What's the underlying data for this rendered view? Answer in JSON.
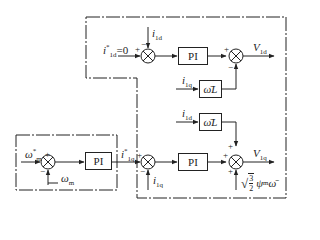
{
  "diagram": {
    "type": "PMSM vector control block diagram",
    "blocks": {
      "pi_d": "PI",
      "pi_speed": "PI",
      "pi_q": "PI",
      "wL_top": "ω̄L",
      "wL_bottom": "ω̄L"
    },
    "signals": {
      "i1d_ref": "i*1d=0",
      "i1d_ref_main": "i",
      "i1d_ref_sub": "1d",
      "i1d_ref_tail": "=0",
      "i1d_fb": "i",
      "i1d_fb_sub": "1d",
      "V1d": "V",
      "V1d_sub": "1d",
      "i1q_to_wL": "i",
      "i1q_to_wL_sub": "1q",
      "i1d_to_wL": "i",
      "i1d_to_wL_sub": "1d",
      "omega_ref": "ω",
      "omega_ref_sub": "m",
      "omega_fb": "ω",
      "omega_fb_sub": "m",
      "i1q_ref": "i",
      "i1q_ref_sub": "1q",
      "i1q_fb": "i",
      "i1q_fb_sub": "1q",
      "V1q": "V",
      "V1q_sub": "1q",
      "feedforward": "√(3/2) ψmω̄",
      "ff_psi": "ψ",
      "ff_psi_sub": "m",
      "ff_omega": "ω̄"
    },
    "signs": {
      "sum_d_plus": "+",
      "sum_d_minus": "−",
      "sum_vd_plus": "+",
      "sum_vd_minus": "−",
      "sum_speed_plus": "+",
      "sum_speed_minus": "−",
      "sum_q_plus": "+",
      "sum_q_minus": "−",
      "sum_vq_plus_top": "+",
      "sum_vq_plus_left": "+",
      "sum_vq_plus_bottom": "+"
    },
    "star": "*",
    "sqrt_num": "3",
    "sqrt_den": "2"
  }
}
